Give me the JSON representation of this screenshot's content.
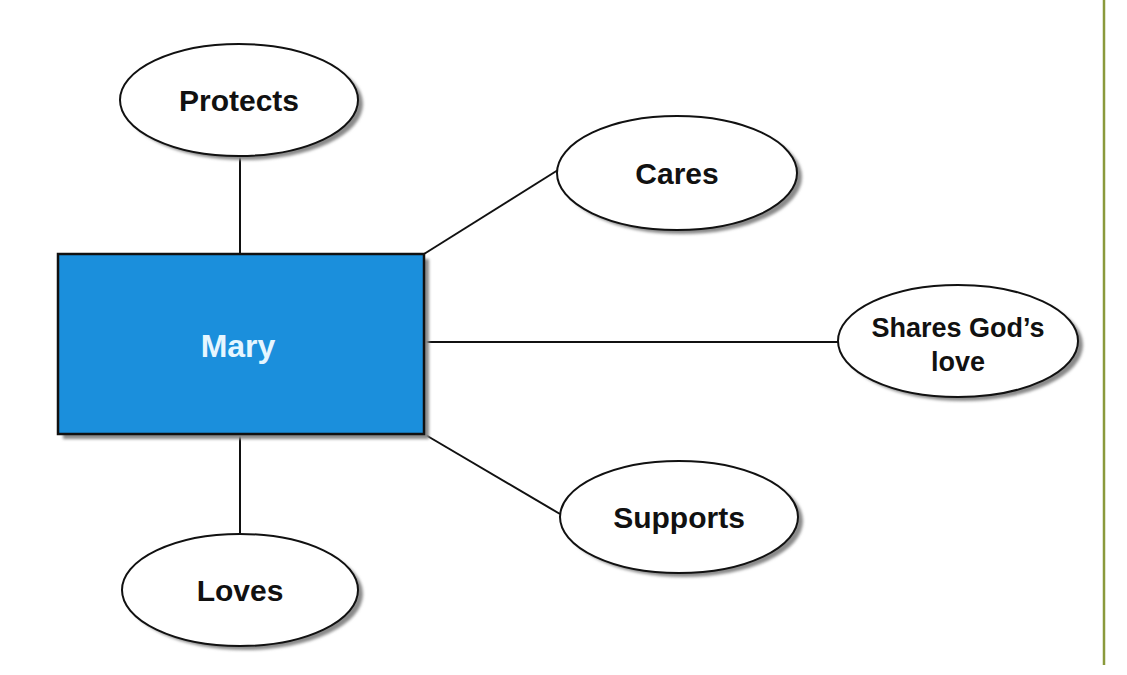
{
  "diagram": {
    "type": "concept-map",
    "colors": {
      "center_fill": "#1b8fdc",
      "center_text": "#e6f6ff",
      "stroke": "#111111",
      "shadow": "#8a8a8a",
      "ellipse_fill": "#ffffff",
      "margin_line": "#8a9a3c"
    },
    "center": {
      "label": "Mary"
    },
    "nodes": [
      {
        "id": "protects",
        "label": "Protects"
      },
      {
        "id": "cares",
        "label": "Cares"
      },
      {
        "id": "shares",
        "label_line1": "Shares God’s",
        "label_line2": "love"
      },
      {
        "id": "supports",
        "label": "Supports"
      },
      {
        "id": "loves",
        "label": "Loves"
      }
    ]
  }
}
